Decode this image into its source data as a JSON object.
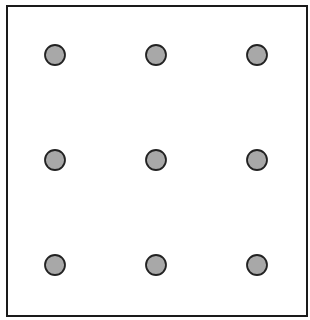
{
  "diagram": {
    "type": "dot-grid",
    "rows": 3,
    "cols": 3,
    "dot_fill": "#a8a8a8",
    "dot_stroke": "#222222",
    "dot_radius": 10,
    "dots": [
      {
        "row": 0,
        "col": 0,
        "cx": 55,
        "cy": 55
      },
      {
        "row": 0,
        "col": 1,
        "cx": 156,
        "cy": 55
      },
      {
        "row": 0,
        "col": 2,
        "cx": 257,
        "cy": 55
      },
      {
        "row": 1,
        "col": 0,
        "cx": 55,
        "cy": 160
      },
      {
        "row": 1,
        "col": 1,
        "cx": 156,
        "cy": 160
      },
      {
        "row": 1,
        "col": 2,
        "cx": 257,
        "cy": 160
      },
      {
        "row": 2,
        "col": 0,
        "cx": 55,
        "cy": 265
      },
      {
        "row": 2,
        "col": 1,
        "cx": 156,
        "cy": 265
      },
      {
        "row": 2,
        "col": 2,
        "cx": 257,
        "cy": 265
      }
    ]
  }
}
